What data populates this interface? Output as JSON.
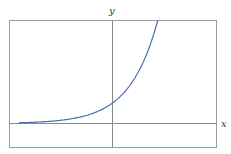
{
  "chart_data": {
    "type": "line",
    "title": "",
    "xlabel": "x",
    "ylabel": "y",
    "function": "exponential growth y = a·b^x",
    "grid": false,
    "legend": null,
    "xlim": [
      -4.5,
      2.5
    ],
    "ylim": [
      -1,
      5
    ],
    "x": [
      -4.0,
      -3.0,
      -2.0,
      -1.0,
      0.0,
      0.5,
      1.0,
      1.5,
      1.8
    ],
    "series": [
      {
        "name": "exponential curve",
        "color": "#4a6fb0",
        "values": [
          0.02,
          0.05,
          0.14,
          0.37,
          1.0,
          1.65,
          2.72,
          4.48,
          6.05
        ]
      }
    ]
  },
  "axes": {
    "x_label": "x",
    "y_label": "y",
    "frame_color": "#999999",
    "axis_color": "#888888"
  }
}
